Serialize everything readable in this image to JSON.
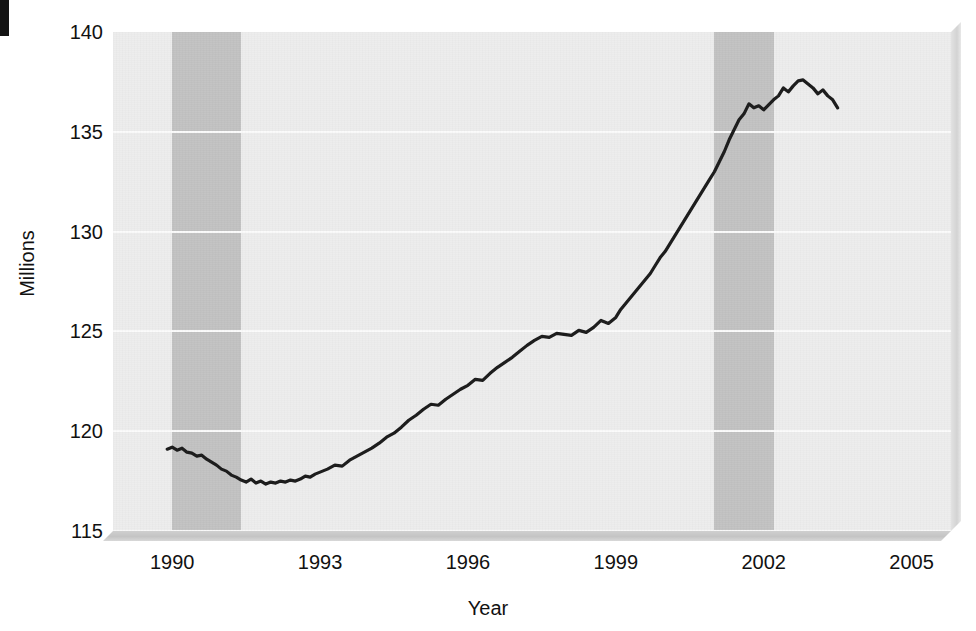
{
  "chart_data": {
    "type": "line",
    "title": "",
    "subtitle": "",
    "xlabel": "Year",
    "ylabel": "Millions",
    "xlim": [
      1988.8,
      2005.8
    ],
    "ylim": [
      115,
      140
    ],
    "xticks": [
      1990,
      1993,
      1996,
      1999,
      2002,
      2005
    ],
    "xticklabels": [
      "1990",
      "1993",
      "1996",
      "1999",
      "2002",
      "2005"
    ],
    "yticks": [
      115,
      120,
      125,
      130,
      135,
      140
    ],
    "yticklabels": [
      "115",
      "120",
      "125",
      "130",
      "135",
      "140"
    ],
    "grid": "horizontal",
    "legend": "none",
    "colors": {
      "line": "#1a1a1a",
      "plot_background": "#ededed",
      "gridline": "#fbfbfb",
      "recession_band": "#c2c2c2",
      "page_background": "#ffffff",
      "text": "#111111"
    },
    "shaded_regions": [
      {
        "name": "recession-band-1990",
        "x_start": 1990.0,
        "x_end": 1991.4
      },
      {
        "name": "recession-band-2001",
        "x_start": 2001.0,
        "x_end": 2002.2
      }
    ],
    "series": [
      {
        "name": "Total nonfarm employment",
        "x": [
          1989.9,
          1990.0,
          1990.1,
          1990.2,
          1990.3,
          1990.4,
          1990.5,
          1990.6,
          1990.7,
          1990.8,
          1990.9,
          1991.0,
          1991.1,
          1991.2,
          1991.3,
          1991.4,
          1991.5,
          1991.6,
          1991.7,
          1991.8,
          1991.9,
          1992.0,
          1992.1,
          1992.2,
          1992.3,
          1992.4,
          1992.5,
          1992.6,
          1992.7,
          1992.8,
          1992.9,
          1993.0,
          1993.15,
          1993.3,
          1993.45,
          1993.6,
          1993.75,
          1993.9,
          1994.05,
          1994.2,
          1994.35,
          1994.5,
          1994.65,
          1994.8,
          1994.95,
          1995.1,
          1995.25,
          1995.4,
          1995.55,
          1995.7,
          1995.85,
          1996.0,
          1996.15,
          1996.3,
          1996.45,
          1996.6,
          1996.75,
          1996.9,
          1997.05,
          1997.2,
          1997.35,
          1997.5,
          1997.65,
          1997.8,
          1997.95,
          1998.1,
          1998.25,
          1998.4,
          1998.55,
          1998.7,
          1998.85,
          1999.0,
          1999.1,
          1999.2,
          1999.3,
          1999.4,
          1999.5,
          1999.6,
          1999.7,
          1999.8,
          1999.9,
          2000.0,
          2000.1,
          2000.2,
          2000.3,
          2000.4,
          2000.5,
          2000.6,
          2000.7,
          2000.8,
          2000.9,
          2001.0,
          2001.1,
          2001.2,
          2001.3,
          2001.4,
          2001.5,
          2001.6,
          2001.7,
          2001.8,
          2001.9,
          2002.0,
          2002.1,
          2002.2,
          2002.3,
          2002.4,
          2002.5,
          2002.6,
          2002.7,
          2002.8,
          2002.9,
          2003.0,
          2003.1,
          2003.2,
          2003.3,
          2003.4,
          2003.5
        ],
        "y": [
          119.1,
          119.2,
          119.05,
          119.15,
          118.95,
          118.9,
          118.75,
          118.8,
          118.6,
          118.45,
          118.3,
          118.1,
          118.0,
          117.8,
          117.7,
          117.55,
          117.45,
          117.6,
          117.4,
          117.5,
          117.35,
          117.45,
          117.4,
          117.5,
          117.45,
          117.55,
          117.5,
          117.6,
          117.75,
          117.7,
          117.85,
          117.95,
          118.1,
          118.3,
          118.25,
          118.55,
          118.75,
          118.95,
          119.15,
          119.4,
          119.7,
          119.9,
          120.2,
          120.55,
          120.8,
          121.1,
          121.35,
          121.3,
          121.6,
          121.85,
          122.1,
          122.3,
          122.6,
          122.55,
          122.9,
          123.2,
          123.45,
          123.7,
          124.0,
          124.3,
          124.55,
          124.75,
          124.7,
          124.9,
          124.85,
          124.8,
          125.05,
          124.95,
          125.2,
          125.55,
          125.4,
          125.7,
          126.1,
          126.4,
          126.7,
          127.0,
          127.3,
          127.6,
          127.9,
          128.3,
          128.7,
          129.0,
          129.4,
          129.8,
          130.2,
          130.6,
          131.0,
          131.4,
          131.8,
          132.2,
          132.6,
          133.0,
          133.5,
          134.0,
          134.6,
          135.1,
          135.6,
          135.9,
          136.4,
          136.2,
          136.3,
          136.1,
          136.35,
          136.6,
          136.8,
          137.2,
          137.0,
          137.3,
          137.55,
          137.6,
          137.4,
          137.2,
          136.9,
          137.1,
          136.8,
          136.6,
          136.2
        ],
        "label_note": "main employment series, millions"
      }
    ],
    "series_key_points": [
      {
        "year": 1989.9,
        "value": 119.1,
        "note": "series start"
      },
      {
        "year": 1991.5,
        "value": 117.4,
        "note": "trough during 1990-91 recession"
      },
      {
        "year": 1995.0,
        "value": 121.0,
        "note": "steady expansion"
      },
      {
        "year": 1997.6,
        "value": 124.8,
        "note": "plateau near 125"
      },
      {
        "year": 2000.5,
        "value": 137.0,
        "note": "sharp late-1990s rise"
      },
      {
        "year": 2000.9,
        "value": 137.6,
        "note": "peak"
      },
      {
        "year": 2002.0,
        "value": 135.6,
        "note": "post-recession low"
      },
      {
        "year": 2003.5,
        "value": 138.3,
        "note": "series end"
      }
    ]
  }
}
